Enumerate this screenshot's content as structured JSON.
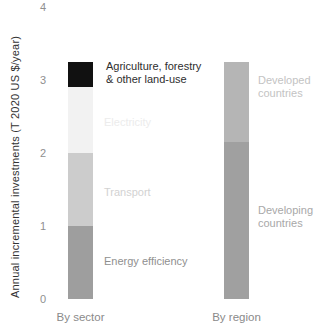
{
  "labels": {
    "ylabel": "Annual incremental investments (T 2020 US $/year)",
    "afolu": "Agriculture, forestry\n& other land-use",
    "electricity": "Electricity",
    "transport": "Transport",
    "energy_efficiency": "Energy efficiency",
    "developed": "Developed\ncountries",
    "developing": "Developing\ncountries",
    "by_sector": "By sector",
    "by_region": "By region"
  },
  "chart_data": {
    "type": "bar",
    "stacked": true,
    "title": "",
    "xlabel": "",
    "ylabel": "Annual incremental investments (T 2020 US $/year)",
    "ylim": [
      0,
      4
    ],
    "yticks": [
      0,
      1,
      2,
      3,
      4
    ],
    "grid": false,
    "legend": "inline-labels-beside-segments",
    "categories": [
      "By sector",
      "By region"
    ],
    "bars": [
      {
        "category": "By sector",
        "total": 3.25,
        "segments": [
          {
            "label": "Energy efficiency",
            "value": 1.0,
            "color": "#9e9e9e",
            "label_color": "#8f8f8f"
          },
          {
            "label": "Transport",
            "value": 1.0,
            "color": "#cccccc",
            "label_color": "#d2d2d2"
          },
          {
            "label": "Electricity",
            "value": 0.9,
            "color": "#f2f2f2",
            "label_color": "#ececec"
          },
          {
            "label": "Agriculture, forestry & other land-use",
            "value": 0.35,
            "color": "#111111",
            "label_color": "#2e2e2e"
          }
        ]
      },
      {
        "category": "By region",
        "total": 3.25,
        "segments": [
          {
            "label": "Developing countries",
            "value": 2.15,
            "color": "#a0a0a0",
            "label_color": "#a8a8a8"
          },
          {
            "label": "Developed countries",
            "value": 1.1,
            "color": "#b5b5b5",
            "label_color": "#c3c3c3"
          }
        ]
      }
    ]
  }
}
